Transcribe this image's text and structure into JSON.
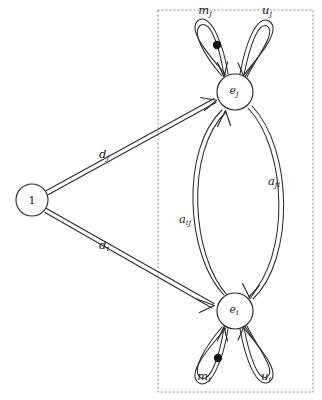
{
  "diagram": {
    "type": "petri-net-graph",
    "background_color": "#ffffff",
    "stroke_color": "#2b2b2b",
    "region": {
      "label": "dotted-boundary-region",
      "style": "dotted",
      "color": "#8a8a8a",
      "x": 158,
      "y": 10,
      "width": 155,
      "height": 382
    },
    "nodes": [
      {
        "id": "one",
        "label": "1",
        "sub": "",
        "italic": false,
        "cx": 32,
        "cy": 200,
        "r": 16
      },
      {
        "id": "ej",
        "label": "e",
        "sub": "j",
        "italic": true,
        "cx": 235,
        "cy": 92,
        "r": 18
      },
      {
        "id": "ei",
        "label": "e",
        "sub": "i",
        "italic": true,
        "cx": 235,
        "cy": 311,
        "r": 18
      }
    ],
    "edges": [
      {
        "id": "d_j",
        "label": "d",
        "sub": "j",
        "from": "one",
        "to": "ej",
        "label_x": 104,
        "label_y": 155,
        "style": "double-line-arrow"
      },
      {
        "id": "d_i",
        "label": "d",
        "sub": "i",
        "from": "one",
        "to": "ei",
        "label_x": 104,
        "label_y": 246,
        "style": "double-line-arrow"
      },
      {
        "id": "a_ij",
        "label": "a",
        "sub": "ij",
        "from": "ei",
        "to": "ej",
        "label_x": 185,
        "label_y": 220,
        "style": "double-line-arc"
      },
      {
        "id": "a_ji",
        "label": "a",
        "sub": "ji",
        "from": "ej",
        "to": "ei",
        "label_x": 274,
        "label_y": 182,
        "style": "double-line-arc"
      }
    ],
    "self_loops": [
      {
        "id": "m_j",
        "label": "m",
        "sub": "j",
        "node": "ej",
        "side": "left",
        "label_x": 205,
        "label_y": 11,
        "has_token": true,
        "token_x": 217,
        "token_y": 45,
        "token_radius": 4.2
      },
      {
        "id": "u_j",
        "label": "u",
        "sub": "j",
        "node": "ej",
        "side": "right",
        "label_x": 267,
        "label_y": 11,
        "has_token": false,
        "token_x": 0,
        "token_y": 0,
        "token_radius": 0
      },
      {
        "id": "m_i",
        "label": "m",
        "sub": "i",
        "node": "ei",
        "side": "left",
        "label_x": 204,
        "label_y": 377,
        "has_token": true,
        "token_x": 218,
        "token_y": 358,
        "token_radius": 4.2
      },
      {
        "id": "u_i",
        "label": "u",
        "sub": "i",
        "node": "ei",
        "side": "right",
        "label_x": 266,
        "label_y": 377,
        "has_token": false,
        "token_x": 0,
        "token_y": 0,
        "token_radius": 0
      }
    ]
  }
}
